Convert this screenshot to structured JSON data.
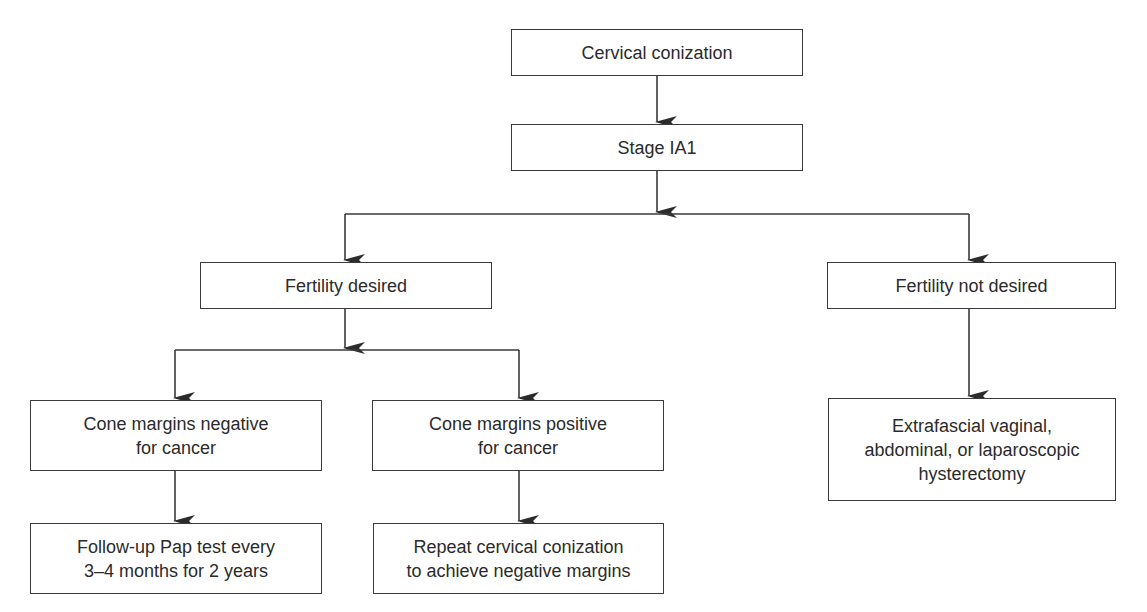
{
  "diagram": {
    "type": "flowchart",
    "nodes": [
      {
        "id": "n1",
        "label": "Cervical conization"
      },
      {
        "id": "n2",
        "label": "Stage IA1"
      },
      {
        "id": "n3",
        "label": "Fertility desired"
      },
      {
        "id": "n4",
        "label": "Fertility not desired"
      },
      {
        "id": "n5",
        "lines": [
          "Cone margins negative",
          "for cancer"
        ]
      },
      {
        "id": "n6",
        "lines": [
          "Cone margins positive",
          "for cancer"
        ]
      },
      {
        "id": "n7",
        "lines": [
          "Extrafascial vaginal,",
          "abdominal, or laparoscopic",
          "hysterectomy"
        ]
      },
      {
        "id": "n8",
        "lines": [
          "Follow-up Pap test every",
          "3–4 months for 2 years"
        ]
      },
      {
        "id": "n9",
        "lines": [
          "Repeat cervical conization",
          "to achieve negative margins"
        ]
      }
    ],
    "edges": [
      [
        "n1",
        "n2"
      ],
      [
        "n2",
        "n3"
      ],
      [
        "n2",
        "n4"
      ],
      [
        "n3",
        "n5"
      ],
      [
        "n3",
        "n6"
      ],
      [
        "n4",
        "n7"
      ],
      [
        "n5",
        "n8"
      ],
      [
        "n6",
        "n9"
      ]
    ],
    "colors": {
      "line": "#3a3a3a",
      "text": "#2b2b2b",
      "background": "#ffffff"
    }
  }
}
